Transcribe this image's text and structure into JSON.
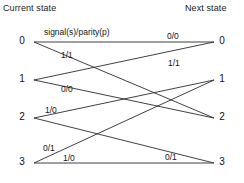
{
  "headers": {
    "left": "Current state",
    "right": "Next state"
  },
  "legend": {
    "notation": "signal(s)/parity(p)"
  },
  "states": {
    "current": [
      {
        "label": "0",
        "x": 22,
        "y": 42
      },
      {
        "label": "1",
        "x": 22,
        "y": 80
      },
      {
        "label": "2",
        "x": 22,
        "y": 118
      },
      {
        "label": "3",
        "x": 22,
        "y": 163
      }
    ],
    "next": [
      {
        "label": "0",
        "x": 222,
        "y": 42
      },
      {
        "label": "1",
        "x": 222,
        "y": 80
      },
      {
        "label": "2",
        "x": 222,
        "y": 118
      },
      {
        "label": "3",
        "x": 222,
        "y": 163
      }
    ]
  },
  "transitions": [
    {
      "name": "edge-0-to-0",
      "from": 0,
      "to": 0,
      "signal": "0",
      "parity": "0",
      "label": "0/0"
    },
    {
      "name": "edge-0-to-2",
      "from": 0,
      "to": 2,
      "signal": "1",
      "parity": "1",
      "label": "1/1"
    },
    {
      "name": "edge-1-to-0",
      "from": 1,
      "to": 0,
      "signal": "1",
      "parity": "1",
      "label": "1/1"
    },
    {
      "name": "edge-1-to-2",
      "from": 1,
      "to": 2,
      "signal": "0",
      "parity": "0",
      "label": "0/0"
    },
    {
      "name": "edge-2-to-1",
      "from": 2,
      "to": 1,
      "signal": "1",
      "parity": "0",
      "label": "1/0"
    },
    {
      "name": "edge-2-to-3",
      "from": 2,
      "to": 3,
      "signal": "0",
      "parity": "1",
      "label": "0/1"
    },
    {
      "name": "edge-3-to-1",
      "from": 3,
      "to": 1,
      "signal": "0",
      "parity": "1",
      "label": "0/1"
    },
    {
      "name": "edge-3-to-3",
      "from": 3,
      "to": 3,
      "signal": "1",
      "parity": "0",
      "label": "1/0"
    }
  ],
  "edge_label_positions": [
    {
      "key": "legend",
      "text": "signal(s)/parity(p)",
      "x": 44,
      "y": 27
    },
    {
      "key": "e-0-0",
      "text": "0/0",
      "x": 167,
      "y": 31
    },
    {
      "key": "e-0-2",
      "text": "1/1",
      "x": 61,
      "y": 50
    },
    {
      "key": "e-1-0",
      "text": "1/1",
      "x": 168,
      "y": 58
    },
    {
      "key": "e-1-2",
      "text": "0/0",
      "x": 61,
      "y": 84
    },
    {
      "key": "e-2-1",
      "text": "1/0",
      "x": 45,
      "y": 105
    },
    {
      "key": "e-2-3",
      "text": "0/1",
      "x": 43,
      "y": 143
    },
    {
      "key": "e-3-1",
      "text": "0/1",
      "x": 165,
      "y": 152
    },
    {
      "key": "e-3-3",
      "text": "1/0",
      "x": 63,
      "y": 153
    }
  ],
  "header_positions": {
    "left": {
      "x": 3,
      "y": 3
    },
    "right": {
      "x": 185,
      "y": 3
    }
  },
  "style": {
    "line_color": "#2b2b2b",
    "text_color": "#141414",
    "background": "#ffffff"
  },
  "diagram_geometry": {
    "left_x": 34,
    "right_x": 214
  }
}
